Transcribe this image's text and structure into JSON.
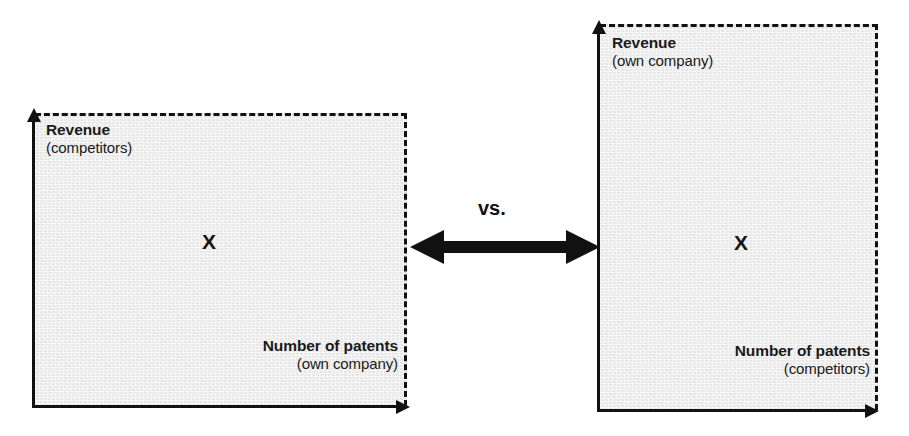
{
  "diagram": {
    "type": "comparison-of-two-scatter-quadrants",
    "comparator_label": "vs.",
    "connector": "double-headed-arrow",
    "panels": [
      {
        "id": "left",
        "y_axis_title": "Revenue",
        "y_axis_subtitle": "(competitors)",
        "x_axis_title": "Number of patents",
        "x_axis_subtitle": "(own company)",
        "data_point_marker": "X"
      },
      {
        "id": "right",
        "y_axis_title": "Revenue",
        "y_axis_subtitle": "(own company)",
        "x_axis_title": "Number of patents",
        "x_axis_subtitle": "(competitors)",
        "data_point_marker": "X"
      }
    ]
  },
  "colors": {
    "panel_fill": "#ececec",
    "ink": "#111111",
    "background": "#ffffff"
  }
}
